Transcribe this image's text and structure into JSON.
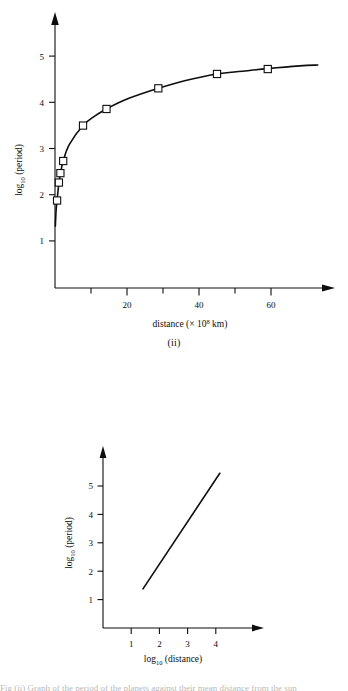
{
  "page": {
    "background_color": "#ffffff",
    "ink_color": "#0d0d0d",
    "bottom_cut_text": "Fig (ii) Graph of the period of the planets against their mean distance from the sun"
  },
  "figures": [
    {
      "id": "ii",
      "caption": "(ii)",
      "x_axis": {
        "title_main": "distance (",
        "title_times": "× 10",
        "title_exponent": "8",
        "title_unit": " km)",
        "title_close": "",
        "full_label": "distance (× 10⁸ km)",
        "tick_labels": [
          "20",
          "40",
          "60"
        ],
        "tick_values": [
          20,
          40,
          60
        ],
        "minor_tick_values": [
          10,
          30,
          50
        ],
        "range": [
          0,
          75
        ],
        "arrow": true
      },
      "y_axis": {
        "title_main": "log",
        "title_sub": "10",
        "title_rest": " (period)",
        "full_label": "log10 (period)",
        "tick_labels": [
          "1",
          "2",
          "3",
          "4",
          "5"
        ],
        "tick_values": [
          1,
          2,
          3,
          4,
          5
        ],
        "range": [
          0,
          5.75
        ],
        "arrow": true
      }
    },
    {
      "id": "iii",
      "caption": "(iii)",
      "x_axis": {
        "title_main": "log",
        "title_sub": "10",
        "title_rest": " (distance)",
        "full_label": "log10 (distance)",
        "tick_labels": [
          "1",
          "2",
          "3",
          "4"
        ],
        "tick_values": [
          1,
          2,
          3,
          4
        ],
        "range": [
          0,
          5.4
        ],
        "arrow": true
      },
      "y_axis": {
        "title_main": "log",
        "title_sub": "10",
        "title_rest": " (period)",
        "full_label": "log10 (period)",
        "tick_labels": [
          "1",
          "2",
          "3",
          "4",
          "5"
        ],
        "tick_values": [
          1,
          2,
          3,
          4,
          5
        ],
        "range": [
          0,
          6.1
        ],
        "arrow": true
      }
    }
  ],
  "chart_data": [
    {
      "type": "scatter",
      "id": "ii",
      "title": "(ii)",
      "subtitle": "",
      "xlabel": "distance (× 10⁸ km)",
      "ylabel": "log₁₀ (period)",
      "xlim": [
        0,
        75
      ],
      "ylim": [
        0,
        5.75
      ],
      "grid": false,
      "legend": "none",
      "marker": "open-square",
      "line": "smooth-logarithmic-curve",
      "x": [
        0.58,
        1.08,
        1.5,
        2.28,
        7.78,
        14.3,
        28.7,
        45.0,
        59.1
      ],
      "y": [
        1.95,
        2.35,
        2.56,
        2.83,
        3.62,
        3.99,
        4.45,
        4.77,
        4.88
      ],
      "points": [
        {
          "x": 0.58,
          "y": 1.95
        },
        {
          "x": 1.08,
          "y": 2.35
        },
        {
          "x": 1.5,
          "y": 2.56
        },
        {
          "x": 2.28,
          "y": 2.83
        },
        {
          "x": 7.78,
          "y": 3.62
        },
        {
          "x": 14.3,
          "y": 3.99
        },
        {
          "x": 28.7,
          "y": 4.45
        },
        {
          "x": 45.0,
          "y": 4.77
        },
        {
          "x": 59.1,
          "y": 4.88
        }
      ],
      "curve": [
        {
          "x": 0.1,
          "y": 1.38
        },
        {
          "x": 0.3,
          "y": 1.72
        },
        {
          "x": 0.58,
          "y": 1.96
        },
        {
          "x": 1.08,
          "y": 2.34
        },
        {
          "x": 1.5,
          "y": 2.55
        },
        {
          "x": 2.28,
          "y": 2.83
        },
        {
          "x": 4.0,
          "y": 3.2
        },
        {
          "x": 7.78,
          "y": 3.62
        },
        {
          "x": 11.0,
          "y": 3.83
        },
        {
          "x": 14.3,
          "y": 3.99
        },
        {
          "x": 20.0,
          "y": 4.21
        },
        {
          "x": 28.7,
          "y": 4.45
        },
        {
          "x": 36.0,
          "y": 4.62
        },
        {
          "x": 45.0,
          "y": 4.77
        },
        {
          "x": 52.0,
          "y": 4.83
        },
        {
          "x": 59.1,
          "y": 4.89
        },
        {
          "x": 68.0,
          "y": 4.95
        },
        {
          "x": 73.0,
          "y": 4.97
        }
      ]
    },
    {
      "type": "line",
      "id": "iii",
      "title": "(iii)",
      "subtitle": "",
      "xlabel": "log₁₀ (distance)",
      "ylabel": "log₁₀ (period)",
      "xlim": [
        0,
        5.4
      ],
      "ylim": [
        0,
        6.1
      ],
      "grid": false,
      "legend": "none",
      "marker": "none",
      "series": [
        {
          "name": "log-log fit",
          "x": [
            1.42,
            4.15
          ],
          "y": [
            1.42,
            5.62
          ]
        }
      ]
    }
  ]
}
